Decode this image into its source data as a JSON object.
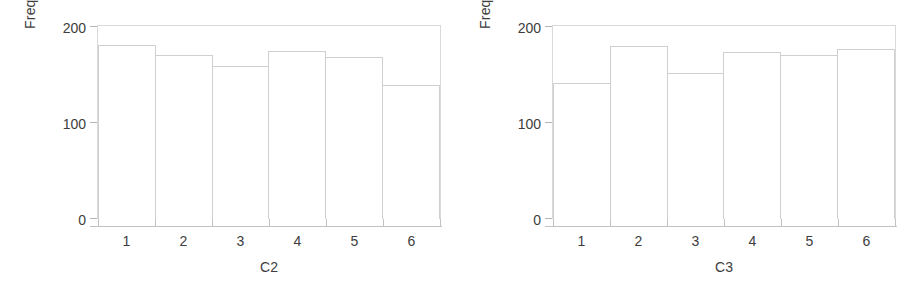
{
  "figure": {
    "background_color": "#ffffff",
    "bar_outline_color": "#cfcfcf",
    "axis_color": "#c2c2c2",
    "text_color": "#3d3d3d"
  },
  "chart_data": [
    {
      "type": "bar",
      "title": "",
      "xlabel": "C2",
      "ylabel": "Frequency",
      "categories": [
        "1",
        "2",
        "3",
        "4",
        "5",
        "6"
      ],
      "values": [
        180,
        170,
        159,
        174,
        168,
        139
      ],
      "ylim": [
        0,
        200
      ],
      "yticks": [
        0,
        100,
        200
      ],
      "ytick_labels": [
        "0",
        "100",
        "200"
      ],
      "xtick_labels": [
        "1",
        "2",
        "3",
        "4",
        "5",
        "6"
      ],
      "grid": false,
      "legend": false
    },
    {
      "type": "bar",
      "title": "",
      "xlabel": "C3",
      "ylabel": "Frequency",
      "categories": [
        "1",
        "2",
        "3",
        "4",
        "5",
        "6"
      ],
      "values": [
        141,
        179,
        151,
        173,
        170,
        176
      ],
      "ylim": [
        0,
        200
      ],
      "yticks": [
        0,
        100,
        200
      ],
      "ytick_labels": [
        "0",
        "100",
        "200"
      ],
      "xtick_labels": [
        "1",
        "2",
        "3",
        "4",
        "5",
        "6"
      ],
      "grid": false,
      "legend": false
    }
  ]
}
